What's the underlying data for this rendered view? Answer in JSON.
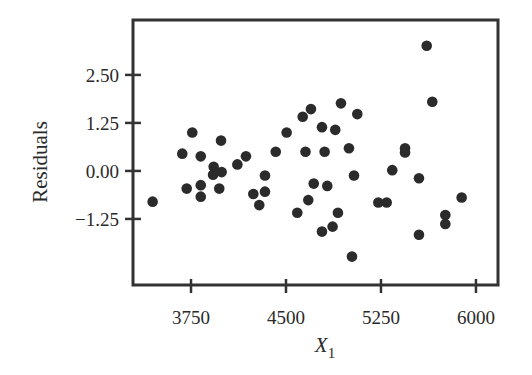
{
  "chart_data": {
    "type": "scatter",
    "title": "",
    "xlabel": "X",
    "xlabel_subscript": "1",
    "ylabel": "Residuals",
    "xlim": [
      3292,
      6174
    ],
    "ylim": [
      -2.97,
      3.93
    ],
    "xticks": [
      3750,
      4500,
      5250,
      6000
    ],
    "xtick_labels": [
      "3750",
      "4500",
      "5250",
      "6000"
    ],
    "yticks": [
      2.5,
      1.25,
      0.0,
      -1.25
    ],
    "ytick_labels": [
      "2.50",
      "1.25",
      "0.00",
      "−1.25"
    ],
    "grid": false,
    "legend": null,
    "marker_color": "#2b2b2b",
    "axis_color": "#333333",
    "points": [
      {
        "x": 3447,
        "y": -0.8
      },
      {
        "x": 3681,
        "y": 0.45
      },
      {
        "x": 3716,
        "y": -0.46
      },
      {
        "x": 3760,
        "y": 1.0
      },
      {
        "x": 3827,
        "y": 0.38
      },
      {
        "x": 3827,
        "y": -0.37
      },
      {
        "x": 3827,
        "y": -0.67
      },
      {
        "x": 3924,
        "y": -0.1
      },
      {
        "x": 3929,
        "y": 0.11
      },
      {
        "x": 3973,
        "y": -0.46
      },
      {
        "x": 3987,
        "y": 0.79
      },
      {
        "x": 3992,
        "y": -0.03
      },
      {
        "x": 4116,
        "y": 0.17
      },
      {
        "x": 4184,
        "y": 0.38
      },
      {
        "x": 4242,
        "y": -0.6
      },
      {
        "x": 4289,
        "y": -0.89
      },
      {
        "x": 4334,
        "y": -0.12
      },
      {
        "x": 4334,
        "y": -0.54
      },
      {
        "x": 4419,
        "y": 0.5
      },
      {
        "x": 4505,
        "y": 1.0
      },
      {
        "x": 4589,
        "y": -1.09
      },
      {
        "x": 4632,
        "y": 1.41
      },
      {
        "x": 4654,
        "y": 0.5
      },
      {
        "x": 4676,
        "y": -0.76
      },
      {
        "x": 4697,
        "y": 1.61
      },
      {
        "x": 4719,
        "y": -0.33
      },
      {
        "x": 4784,
        "y": 1.14
      },
      {
        "x": 4784,
        "y": -1.58
      },
      {
        "x": 4805,
        "y": 0.5
      },
      {
        "x": 4826,
        "y": -0.39
      },
      {
        "x": 4868,
        "y": -1.45
      },
      {
        "x": 4889,
        "y": 1.07
      },
      {
        "x": 4910,
        "y": -1.09
      },
      {
        "x": 4934,
        "y": 1.76
      },
      {
        "x": 4997,
        "y": 0.59
      },
      {
        "x": 5021,
        "y": -2.23
      },
      {
        "x": 5037,
        "y": -0.12
      },
      {
        "x": 5063,
        "y": 1.48
      },
      {
        "x": 5229,
        "y": -0.82
      },
      {
        "x": 5295,
        "y": -0.82
      },
      {
        "x": 5339,
        "y": 0.02
      },
      {
        "x": 5440,
        "y": 0.59
      },
      {
        "x": 5440,
        "y": 0.48
      },
      {
        "x": 5550,
        "y": -0.19
      },
      {
        "x": 5550,
        "y": -1.66
      },
      {
        "x": 5611,
        "y": 3.26
      },
      {
        "x": 5655,
        "y": 1.8
      },
      {
        "x": 5758,
        "y": -1.15
      },
      {
        "x": 5758,
        "y": -1.38
      },
      {
        "x": 5887,
        "y": -0.69
      }
    ]
  }
}
